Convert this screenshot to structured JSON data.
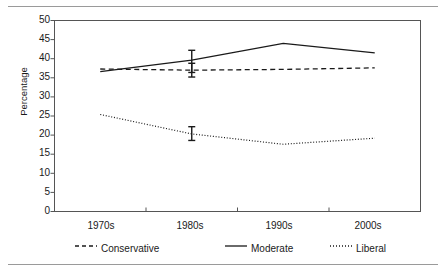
{
  "chart_data": {
    "type": "line",
    "title": "",
    "xlabel": "",
    "ylabel": "Percentage",
    "categories": [
      "1970s",
      "1980s",
      "1990s",
      "2000s"
    ],
    "ylim": [
      0,
      50
    ],
    "ytick_step": 5,
    "yticks": [
      0,
      5,
      10,
      15,
      20,
      25,
      30,
      35,
      40,
      45,
      50
    ],
    "grid": false,
    "legend_position": "bottom",
    "series": [
      {
        "name": "Conservative",
        "style": "dashed",
        "color": "#1a1a1a",
        "values": [
          37.3,
          37.0,
          37.2,
          37.6
        ],
        "error_bars": [
          {
            "category": "1980s",
            "value": 37.0,
            "low": 35.2,
            "high": 38.8
          }
        ]
      },
      {
        "name": "Moderate",
        "style": "solid",
        "color": "#1a1a1a",
        "values": [
          36.6,
          39.6,
          44.0,
          41.5
        ],
        "error_bars": [
          {
            "category": "1980s",
            "value": 39.6,
            "low": 36.4,
            "high": 42.2
          }
        ]
      },
      {
        "name": "Liberal",
        "style": "dotted",
        "color": "#1a1a1a",
        "values": [
          25.4,
          20.3,
          17.6,
          19.2
        ],
        "error_bars": [
          {
            "category": "1980s",
            "value": 20.3,
            "low": 18.6,
            "high": 22.2
          }
        ]
      }
    ]
  },
  "axis": {
    "y_label": "Percentage",
    "y_tick_labels": [
      "50",
      "45",
      "40",
      "35",
      "30",
      "25",
      "20",
      "15",
      "10",
      "5",
      "0"
    ],
    "x_tick_labels": [
      "1970s",
      "1980s",
      "1990s",
      "2000s"
    ]
  },
  "legend": {
    "items": [
      {
        "label": "Conservative",
        "style": "dashed"
      },
      {
        "label": "Moderate",
        "style": "solid"
      },
      {
        "label": "Liberal",
        "style": "dotted"
      }
    ]
  }
}
